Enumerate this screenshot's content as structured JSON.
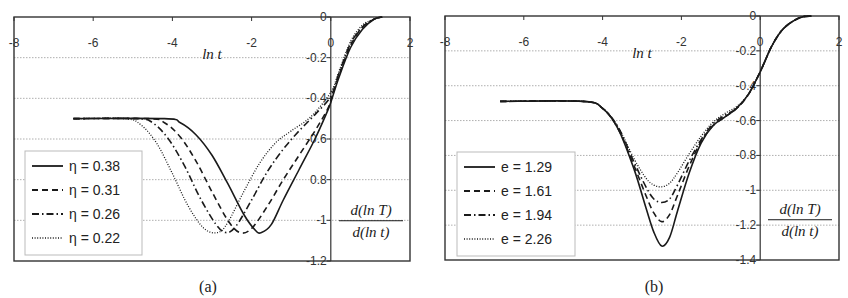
{
  "chart_data": [
    {
      "type": "line",
      "panel": "a",
      "caption": "(a)",
      "xlabel": "ln t",
      "ylabel_num": "d(ln T)",
      "ylabel_den": "d(ln t)",
      "xlim": [
        -8,
        2
      ],
      "ylim": [
        -1.2,
        0
      ],
      "x_ticks": [
        "-8",
        "-6",
        "-4",
        "-2",
        "0",
        "2"
      ],
      "y_ticks": [
        "0",
        "-0.2",
        "-0.4",
        "-0.6",
        "0.8",
        "-1",
        "-1.2"
      ],
      "y_tick_values": [
        0,
        -0.2,
        -0.4,
        -0.6,
        -0.8,
        -1,
        -1.2
      ],
      "grid": "horizontal dotted",
      "legend_position": "lower left",
      "series": [
        {
          "name": "η = 0.38",
          "style": "solid",
          "x": [
            -6.5,
            -4.2,
            -3.8,
            -3.4,
            -3.0,
            -2.6,
            -2.2,
            -1.9,
            -1.75,
            -1.5,
            -1.2,
            -0.8,
            -0.4,
            -0.1,
            0.0,
            0.2,
            0.5,
            0.8,
            1.1,
            1.3
          ],
          "y": [
            -0.5,
            -0.5,
            -0.52,
            -0.58,
            -0.68,
            -0.82,
            -0.97,
            -1.05,
            -1.06,
            -1.02,
            -0.9,
            -0.75,
            -0.6,
            -0.47,
            -0.42,
            -0.3,
            -0.15,
            -0.06,
            -0.01,
            0
          ]
        },
        {
          "name": "η = 0.31",
          "style": "dashed",
          "x": [
            -6.5,
            -4.6,
            -4.2,
            -3.8,
            -3.4,
            -3.0,
            -2.6,
            -2.3,
            -2.0,
            -1.6,
            -1.2,
            -0.8,
            -0.4,
            -0.1,
            0.0,
            0.2,
            0.5,
            0.8,
            1.1,
            1.3
          ],
          "y": [
            -0.5,
            -0.5,
            -0.52,
            -0.59,
            -0.71,
            -0.86,
            -1.0,
            -1.06,
            -1.04,
            -0.93,
            -0.8,
            -0.68,
            -0.56,
            -0.46,
            -0.41,
            -0.29,
            -0.14,
            -0.05,
            -0.01,
            0
          ]
        },
        {
          "name": "η = 0.26",
          "style": "dashdot",
          "x": [
            -6.5,
            -4.9,
            -4.5,
            -4.1,
            -3.7,
            -3.3,
            -2.9,
            -2.65,
            -2.4,
            -2.0,
            -1.6,
            -1.2,
            -0.8,
            -0.4,
            0.0,
            0.2,
            0.5,
            0.8,
            1.1,
            1.3
          ],
          "y": [
            -0.5,
            -0.5,
            -0.52,
            -0.6,
            -0.73,
            -0.89,
            -1.02,
            -1.06,
            -1.03,
            -0.9,
            -0.76,
            -0.65,
            -0.56,
            -0.48,
            -0.39,
            -0.28,
            -0.13,
            -0.05,
            -0.01,
            0
          ]
        },
        {
          "name": "η = 0.22",
          "style": "dotted",
          "x": [
            -6.5,
            -5.2,
            -4.8,
            -4.4,
            -4.0,
            -3.6,
            -3.2,
            -2.85,
            -2.6,
            -2.2,
            -1.8,
            -1.4,
            -1.0,
            -0.5,
            0.0,
            0.2,
            0.5,
            0.8,
            1.1,
            1.3
          ],
          "y": [
            -0.5,
            -0.5,
            -0.53,
            -0.62,
            -0.77,
            -0.93,
            -1.04,
            -1.06,
            -1.01,
            -0.86,
            -0.72,
            -0.62,
            -0.56,
            -0.49,
            -0.37,
            -0.27,
            -0.12,
            -0.04,
            -0.01,
            0
          ]
        }
      ]
    },
    {
      "type": "line",
      "panel": "b",
      "caption": "(b)",
      "xlabel": "ln t",
      "ylabel_num": "d(ln T)",
      "ylabel_den": "d(ln t)",
      "xlim": [
        -8,
        2
      ],
      "ylim": [
        -1.4,
        0
      ],
      "x_ticks": [
        "-8",
        "-6",
        "-4",
        "-2",
        "0",
        "2"
      ],
      "y_ticks": [
        "0",
        "-0.2",
        "-0.4",
        "-0.6",
        "-0.8",
        "-1",
        "-1.2",
        "-1.4"
      ],
      "y_tick_values": [
        0,
        -0.2,
        -0.4,
        -0.6,
        -0.8,
        -1,
        -1.2,
        -1.4
      ],
      "grid": "horizontal dotted",
      "legend_position": "lower left",
      "series": [
        {
          "name": "e = 1.29",
          "style": "solid",
          "x": [
            -6.6,
            -4.5,
            -4.0,
            -3.6,
            -3.2,
            -2.9,
            -2.7,
            -2.5,
            -2.3,
            -2.1,
            -1.8,
            -1.5,
            -1.2,
            -0.9,
            -0.6,
            -0.3,
            0.0,
            0.3,
            0.6,
            1.0,
            1.3
          ],
          "y": [
            -0.49,
            -0.49,
            -0.53,
            -0.65,
            -0.88,
            -1.1,
            -1.24,
            -1.32,
            -1.27,
            -1.12,
            -0.9,
            -0.73,
            -0.63,
            -0.58,
            -0.53,
            -0.45,
            -0.32,
            -0.17,
            -0.07,
            -0.01,
            0
          ]
        },
        {
          "name": "e = 1.61",
          "style": "dashed",
          "x": [
            -6.6,
            -4.5,
            -4.0,
            -3.6,
            -3.2,
            -2.9,
            -2.7,
            -2.5,
            -2.3,
            -2.1,
            -1.8,
            -1.5,
            -1.2,
            -0.9,
            -0.6,
            -0.3,
            0.0,
            0.3,
            0.6,
            1.0,
            1.3
          ],
          "y": [
            -0.49,
            -0.49,
            -0.53,
            -0.65,
            -0.86,
            -1.03,
            -1.13,
            -1.18,
            -1.14,
            -1.03,
            -0.86,
            -0.72,
            -0.63,
            -0.58,
            -0.53,
            -0.45,
            -0.32,
            -0.17,
            -0.07,
            -0.01,
            0
          ]
        },
        {
          "name": "e = 1.94",
          "style": "dashdot",
          "x": [
            -6.6,
            -4.5,
            -4.0,
            -3.6,
            -3.2,
            -2.9,
            -2.7,
            -2.5,
            -2.3,
            -2.1,
            -1.8,
            -1.5,
            -1.2,
            -0.9,
            -0.6,
            -0.3,
            0.0,
            0.3,
            0.6,
            1.0,
            1.3
          ],
          "y": [
            -0.49,
            -0.49,
            -0.53,
            -0.64,
            -0.84,
            -0.98,
            -1.05,
            -1.07,
            -1.05,
            -0.97,
            -0.83,
            -0.71,
            -0.62,
            -0.57,
            -0.53,
            -0.45,
            -0.32,
            -0.17,
            -0.07,
            -0.01,
            0
          ]
        },
        {
          "name": "e = 2.26",
          "style": "dotted",
          "x": [
            -6.6,
            -4.5,
            -4.0,
            -3.6,
            -3.2,
            -2.9,
            -2.7,
            -2.5,
            -2.3,
            -2.1,
            -1.8,
            -1.5,
            -1.2,
            -0.9,
            -0.6,
            -0.3,
            0.0,
            0.3,
            0.6,
            1.0,
            1.3
          ],
          "y": [
            -0.49,
            -0.49,
            -0.53,
            -0.64,
            -0.82,
            -0.93,
            -0.97,
            -0.98,
            -0.96,
            -0.9,
            -0.79,
            -0.69,
            -0.61,
            -0.56,
            -0.52,
            -0.45,
            -0.32,
            -0.17,
            -0.07,
            -0.01,
            0
          ]
        }
      ]
    }
  ],
  "panels": {
    "a": {
      "caption": "(a)",
      "xlabel": "ln t",
      "ylabel_num": "d(ln T)",
      "ylabel_den": "d(ln t)",
      "legend": [
        "η = 0.38",
        "η = 0.31",
        "η = 0.26",
        "η = 0.22"
      ]
    },
    "b": {
      "caption": "(b)",
      "xlabel": "ln t",
      "ylabel_num": "d(ln T)",
      "ylabel_den": "d(ln t)",
      "legend": [
        "e = 1.29",
        "e = 1.61",
        "e = 1.94",
        "e = 2.26"
      ]
    }
  },
  "colors": {
    "line": "#1a1a1a",
    "frame": "#333333",
    "grid": "#9a9a9a",
    "legend_border": "#bbbbbb"
  }
}
